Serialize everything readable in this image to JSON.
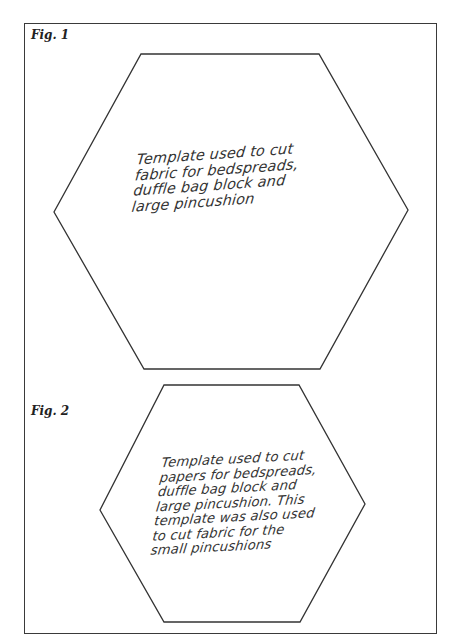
{
  "figures": [
    {
      "label": "Fig. 1",
      "caption_lines": [
        "Template used to cut",
        "fabric for bedspreads,",
        "duffle bag block and",
        "large pincushion"
      ],
      "hexagon": "141,54 319,54 408,210 320,369 144,369 54,212"
    },
    {
      "label": "Fig. 2",
      "caption_lines": [
        "Template used to cut",
        "papers for bedspreads,",
        "duffle bag block and",
        "large pincushion. This",
        "template was also used",
        "to cut fabric for the",
        "small pincushions"
      ],
      "hexagon": "164,385 299,385 365,504 300,622 164,622 100,510"
    }
  ],
  "colors": {
    "line": "#333333",
    "background": "#ffffff"
  }
}
